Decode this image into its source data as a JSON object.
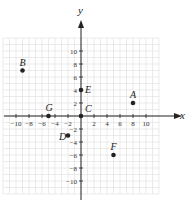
{
  "axes": {
    "x_label": "x",
    "y_label": "y",
    "range": [
      -10,
      10
    ],
    "tick_step": 2,
    "x_ticks": [
      "-10",
      "-8",
      "-6",
      "-4",
      "-2",
      "2",
      "4",
      "6",
      "8",
      "10"
    ],
    "y_ticks": [
      "10",
      "8",
      "6",
      "4",
      "2",
      "-2",
      "-4",
      "-6",
      "-8",
      "-10"
    ]
  },
  "points": [
    {
      "label": "A",
      "x": 8,
      "y": 2
    },
    {
      "label": "B",
      "x": -9,
      "y": 7
    },
    {
      "label": "C",
      "x": 0,
      "y": 0
    },
    {
      "label": "D",
      "x": -2,
      "y": -3
    },
    {
      "label": "E",
      "x": 0,
      "y": 4
    },
    {
      "label": "F",
      "x": 5,
      "y": -6
    },
    {
      "label": "G",
      "x": -5,
      "y": 0
    }
  ]
}
